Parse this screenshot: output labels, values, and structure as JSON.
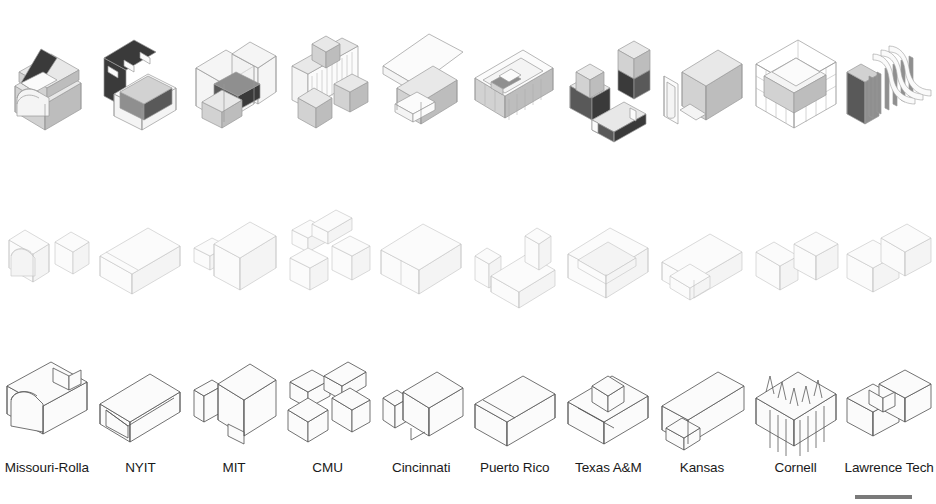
{
  "page": {
    "background_color": "#ffffff",
    "row_count": 3,
    "column_count": 10
  },
  "rows": [
    {
      "id": "rendered",
      "name": "shaded-rendered-models",
      "description": "Top row — shaded isometric building models with dark and gray massing volumes"
    },
    {
      "id": "massing",
      "name": "light-massing-models",
      "description": "Middle row — light gray transparent massing volume diagrams"
    },
    {
      "id": "line",
      "name": "line-drawing-models",
      "description": "Bottom row — dark outline wireframe line drawings"
    }
  ],
  "columns": [
    {
      "index": 0,
      "label": "Missouri-Rolla"
    },
    {
      "index": 1,
      "label": "NYIT"
    },
    {
      "index": 2,
      "label": "MIT"
    },
    {
      "index": 3,
      "label": "CMU"
    },
    {
      "index": 4,
      "label": "Cincinnati"
    },
    {
      "index": 5,
      "label": "Puerto Rico"
    },
    {
      "index": 6,
      "label": "Texas A&M"
    },
    {
      "index": 7,
      "label": "Kansas"
    },
    {
      "index": 8,
      "label": "Cornell"
    },
    {
      "index": 9,
      "label": "Lawrence Tech"
    }
  ],
  "scrollbar": {
    "name": "horizontal-scrollbar",
    "color": "#7a7a7a",
    "visible": true
  },
  "colors": {
    "background": "#ffffff",
    "label_text": "#1a1a1a",
    "rendered_stroke": "#9a9a9a",
    "massing_stroke": "#c2c2c2",
    "line_stroke": "#5a5a5a",
    "dark_volume": "#3a3a3a",
    "mid_volume": "#8f8f8f",
    "light_volume": "#e8e8e8"
  }
}
